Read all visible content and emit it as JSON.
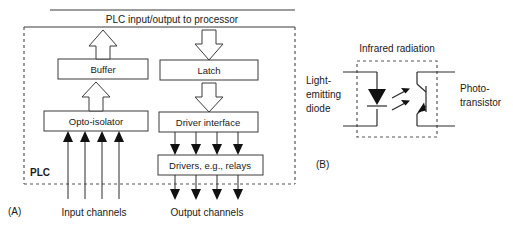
{
  "figure": {
    "panel_a": {
      "caption": "(A)",
      "bus_label": "PLC input/output to processor",
      "enclosure_label": "PLC",
      "boxes": {
        "buffer": "Buffer",
        "latch": "Latch",
        "opto_isolator": "Opto-isolator",
        "driver_interface": "Driver interface",
        "drivers": "Drivers, e.g., relays"
      },
      "channels": {
        "input": "Input channels",
        "output": "Output channels"
      },
      "input_channel_count": 4,
      "output_channel_count": 4
    },
    "panel_b": {
      "caption": "(B)",
      "radiation_label": "Infrared radiation",
      "left_label_lines": [
        "Light-",
        "emitting",
        "diode"
      ],
      "right_label_lines": [
        "Photo-",
        "transistor"
      ],
      "components": {
        "led": "light-emitting-diode",
        "phototransistor": "photo-transistor"
      }
    },
    "colors": {
      "stroke": "#3a3a3a",
      "fill": "#ffffff",
      "text": "#1a1a1a",
      "dashed": "#555555",
      "solid_arrow": "#111111"
    }
  }
}
